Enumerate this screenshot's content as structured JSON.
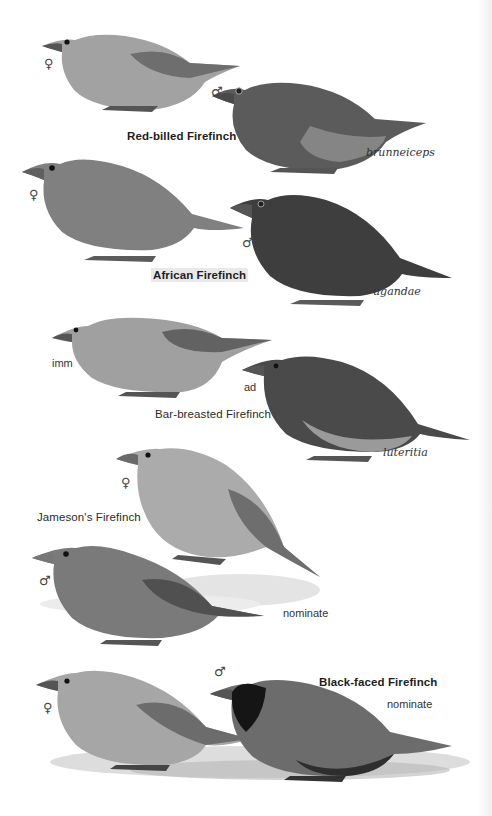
{
  "plate": {
    "palette": {
      "background": "#ffffff",
      "bird_light": "#a9a9a9",
      "bird_mid": "#858585",
      "bird_dark": "#5a5a5a",
      "bird_black": "#1c1c1c",
      "label_highlight": "#e9e9e9"
    },
    "groups": [
      {
        "species": "Red-billed Firefinch",
        "figures": [
          {
            "sex_symbol": "♀",
            "form": ""
          },
          {
            "sex_symbol": "♂",
            "form": "brunneiceps"
          }
        ]
      },
      {
        "species": "African Firefinch",
        "highlighted": true,
        "figures": [
          {
            "sex_symbol": "♀",
            "form": ""
          },
          {
            "sex_symbol": "♂",
            "form": "ugandae"
          }
        ]
      },
      {
        "species": "Bar-breasted Firefinch",
        "figures": [
          {
            "age": "imm",
            "form": ""
          },
          {
            "age": "ad",
            "form": "luteritia"
          }
        ]
      },
      {
        "species": "Jameson's Firefinch",
        "figures": [
          {
            "sex_symbol": "♀",
            "form": ""
          },
          {
            "sex_symbol": "♂",
            "form": "nominate"
          }
        ]
      },
      {
        "species": "Black-faced Firefinch",
        "figures": [
          {
            "sex_symbol": "♀",
            "form": ""
          },
          {
            "sex_symbol": "♂",
            "form": "nominate"
          }
        ]
      }
    ]
  }
}
